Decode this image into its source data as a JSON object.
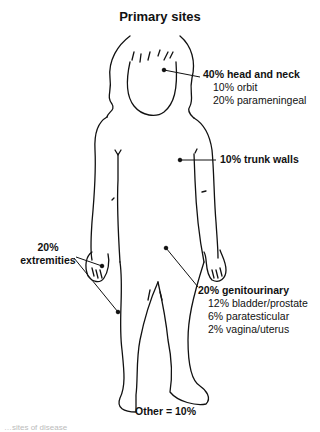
{
  "title": "Primary sites",
  "sites": {
    "head_neck": {
      "label": "40% head and neck",
      "sub": [
        "10% orbit",
        "20% parameningeal"
      ]
    },
    "trunk": {
      "label": "10% trunk walls"
    },
    "extremities": {
      "line1": "20%",
      "line2": "extremities"
    },
    "genitourinary": {
      "label": "20% genitourinary",
      "sub": [
        "12% bladder/prostate",
        "6% paratesticular",
        "2% vagina/uterus"
      ]
    },
    "other": {
      "label": "Other = 10%"
    }
  },
  "caption": "…sites of disease",
  "colors": {
    "line": "#111111",
    "background": "#ffffff"
  }
}
